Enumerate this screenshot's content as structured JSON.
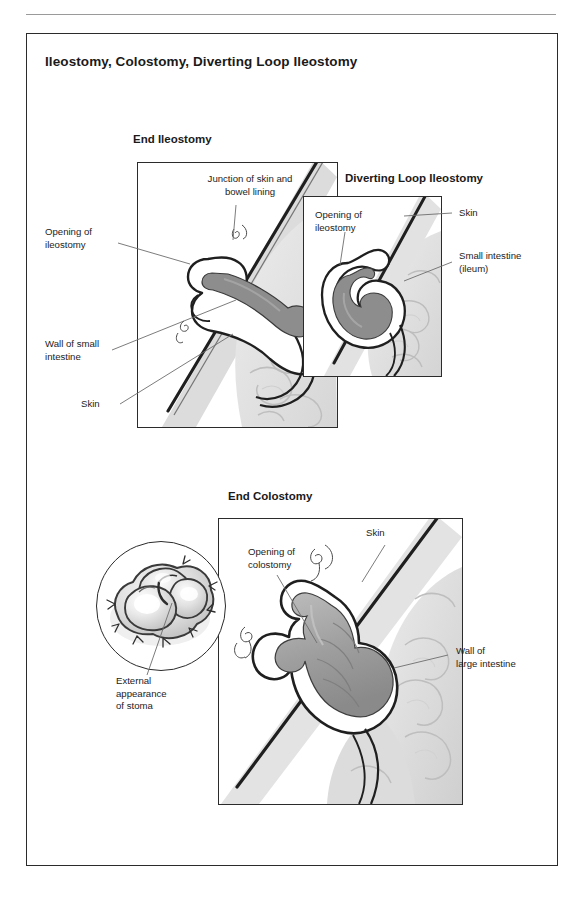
{
  "document": {
    "title": "Ileostomy, Colostomy, Diverting Loop Ileostomy"
  },
  "panels": [
    {
      "id": "end-ileostomy",
      "heading": "End Ileostomy",
      "labels": [
        {
          "id": "junction-skin-bowel",
          "text": "Junction of skin and\nbowel lining"
        },
        {
          "id": "opening-of-ileostomy",
          "text": "Opening of\nileostomy"
        },
        {
          "id": "wall-of-small-intestine",
          "text": "Wall of small\nintestine"
        },
        {
          "id": "skin",
          "text": "Skin"
        }
      ]
    },
    {
      "id": "diverting-loop-ileostomy",
      "heading": "Diverting Loop Ileostomy",
      "labels": [
        {
          "id": "opening-of-ileostomy",
          "text": "Opening of\nileostomy"
        },
        {
          "id": "skin",
          "text": "Skin"
        },
        {
          "id": "small-intestine-ileum",
          "text": "Small intestine\n(ileum)"
        }
      ]
    },
    {
      "id": "end-colostomy",
      "heading": "End Colostomy",
      "labels": [
        {
          "id": "opening-of-colostomy",
          "text": "Opening of\ncolostomy"
        },
        {
          "id": "skin",
          "text": "Skin"
        },
        {
          "id": "wall-of-large-intestine",
          "text": "Wall of\nlarge intestine"
        },
        {
          "id": "external-appearance-of-stoma",
          "text": "External\nappearance\nof stoma"
        }
      ]
    }
  ],
  "colors": {
    "frame": "#2b2b2b",
    "rule": "#9a9a9a",
    "text": "#1c1c1c",
    "bowel_lumen": "#8d8d8d",
    "bowel_wall": "#ffffff",
    "tissue_light": "#e4e4e4",
    "tissue_mid": "#c9c9c9",
    "tissue_dark": "#a8a8a8",
    "leader": "#6d6d6d"
  }
}
